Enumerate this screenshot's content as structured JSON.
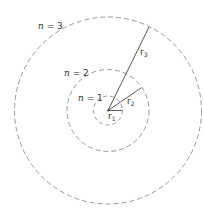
{
  "diagram": {
    "type": "bohr-orbits",
    "center": {
      "x": 108,
      "y": 110.5
    },
    "orbits": [
      {
        "n_label": "n = 1",
        "n_var": "n",
        "n_val": "1",
        "radius": 14.5,
        "radius_label": "r",
        "radius_sub": "1"
      },
      {
        "n_label": "n = 2",
        "n_var": "n",
        "n_val": "2",
        "radius": 41,
        "radius_label": "r",
        "radius_sub": "2"
      },
      {
        "n_label": "n = 3",
        "n_var": "n",
        "n_val": "3",
        "radius": 93.5,
        "radius_label": "r",
        "radius_sub": "3"
      }
    ],
    "colors": {
      "circle": "#999999",
      "line": "#444444",
      "text": "#333333"
    }
  },
  "labels": {
    "n1": {
      "var": "n",
      "eq": " = 1"
    },
    "n2": {
      "var": "n",
      "eq": " = 2"
    },
    "n3": {
      "var": "n",
      "eq": " = 3"
    },
    "r1": {
      "r": "r",
      "sub": "1"
    },
    "r2": {
      "r": "r",
      "sub": "2"
    },
    "r3": {
      "r": "r",
      "sub": "3"
    }
  }
}
